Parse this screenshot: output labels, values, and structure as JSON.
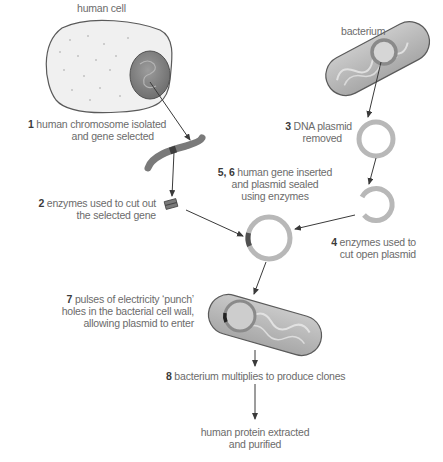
{
  "title_labels": {
    "human_cell": "human cell",
    "bacterium": "bacterium"
  },
  "steps": [
    {
      "num": "1",
      "line1": "human chromosome isolated",
      "line2": "and gene selected"
    },
    {
      "num": "2",
      "line1": "enzymes used to cut out",
      "line2": "the selected gene"
    },
    {
      "num": "3",
      "line1": "DNA plasmid",
      "line2": "removed"
    },
    {
      "num": "4",
      "line1": "enzymes used to",
      "line2": "cut open plasmid"
    },
    {
      "num": "5, 6",
      "line1": "human gene inserted",
      "line2": "and plasmid sealed",
      "line3": "using enzymes"
    },
    {
      "num": "7",
      "line1": "pulses of electricity ‘punch’",
      "line2": "holes in the bacterial cell wall,",
      "line3": "allowing plasmid to enter"
    },
    {
      "num": "8",
      "line1": "bacterium multiplies to produce clones"
    }
  ],
  "final": {
    "line1": "human protein extracted",
    "line2": "and purified"
  },
  "colors": {
    "cell_fill": "#eeeeee",
    "outline": "#5a5a5a",
    "nucleus": "#8c8c8c",
    "plasmid": "#b8b8b8",
    "gene": "#555555",
    "arrow": "#3a3a3a",
    "label_text": "#6b6b6b"
  }
}
